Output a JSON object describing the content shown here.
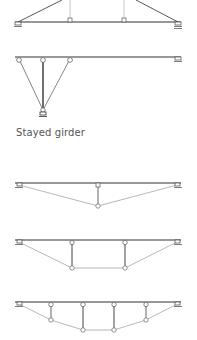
{
  "caption": "Stayed girder",
  "colors": {
    "girder": "#333333",
    "member": "#888888",
    "strut": "#444444",
    "node_fill": "#ffffff",
    "caption": "#555555"
  },
  "diagrams": [
    {
      "id": "suspended-truss-top",
      "girder_y": 22,
      "x_start": 17,
      "x_end": 180,
      "nodes": [
        70,
        124
      ]
    },
    {
      "id": "cantilever-stayed",
      "girder_y": 57,
      "x_start": 17,
      "x_end": 180,
      "nodes": [
        19,
        43,
        70
      ],
      "anchor": [
        43,
        112
      ]
    },
    {
      "id": "single-post-kingpost",
      "girder_y": 183,
      "x_start": 17,
      "x_end": 180,
      "posts": [
        98
      ],
      "bottom_y": 206
    },
    {
      "id": "two-post-queenpost",
      "girder_y": 240,
      "x_start": 17,
      "x_end": 180,
      "posts": [
        72,
        125
      ],
      "bottom_y": 268
    },
    {
      "id": "four-post-polygonal",
      "girder_y": 302,
      "x_start": 17,
      "x_end": 180,
      "posts": [
        51,
        83,
        114,
        146
      ],
      "bottom_y": [
        320,
        330,
        330,
        320
      ]
    }
  ]
}
